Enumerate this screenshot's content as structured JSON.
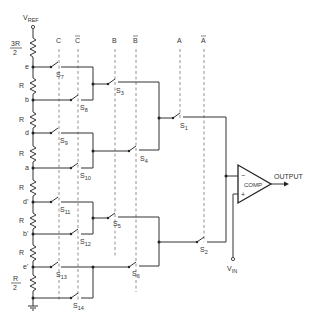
{
  "diagram": {
    "type": "circuit-schematic",
    "title": "",
    "reference": {
      "label": "V",
      "subscript": "REF"
    },
    "input": {
      "label": "V",
      "subscript": "IN"
    },
    "comparator": {
      "label": "COMP",
      "minus": "−",
      "plus": "+"
    },
    "output_label": "OUTPUT",
    "control_lines": [
      {
        "id": "C",
        "label": "C",
        "overbar": false
      },
      {
        "id": "Cbar",
        "label": "C",
        "overbar": true
      },
      {
        "id": "B",
        "label": "B",
        "overbar": false
      },
      {
        "id": "Bbar",
        "label": "B",
        "overbar": true
      },
      {
        "id": "A",
        "label": "A",
        "overbar": false
      },
      {
        "id": "Abar",
        "label": "A",
        "overbar": true
      }
    ],
    "resistors": [
      {
        "num": "3R",
        "den": "2"
      },
      {
        "label": "R"
      },
      {
        "label": "R"
      },
      {
        "label": "R"
      },
      {
        "label": "R"
      },
      {
        "label": "R"
      },
      {
        "label": "R"
      },
      {
        "num": "R",
        "den": "2"
      }
    ],
    "nodes": [
      "e",
      "b",
      "d",
      "a",
      "d'",
      "b'",
      "e'"
    ],
    "switches": [
      {
        "name": "S",
        "sub": "1"
      },
      {
        "name": "S",
        "sub": "2"
      },
      {
        "name": "S",
        "sub": "3"
      },
      {
        "name": "S",
        "sub": "4"
      },
      {
        "name": "S",
        "sub": "5"
      },
      {
        "name": "S",
        "sub": "6"
      },
      {
        "name": "S",
        "sub": "7"
      },
      {
        "name": "S",
        "sub": "8"
      },
      {
        "name": "S",
        "sub": "9"
      },
      {
        "name": "S",
        "sub": "10"
      },
      {
        "name": "S",
        "sub": "11"
      },
      {
        "name": "S",
        "sub": "12"
      },
      {
        "name": "S",
        "sub": "13"
      },
      {
        "name": "S",
        "sub": "14"
      }
    ]
  }
}
